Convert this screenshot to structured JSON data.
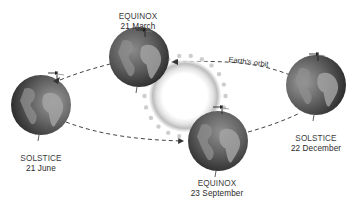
{
  "diagram": {
    "orbit_label": "Earth's orbit",
    "sun": {
      "name": "Sun"
    },
    "positions": [
      {
        "id": "june",
        "event": "SOLSTICE",
        "date": "21 June"
      },
      {
        "id": "march",
        "event": "EQUINOX",
        "date": "21 March"
      },
      {
        "id": "september",
        "event": "EQUINOX",
        "date": "23 September"
      },
      {
        "id": "december",
        "event": "SOLSTICE",
        "date": "22 December"
      }
    ],
    "colors": {
      "background": "#ffffff",
      "text": "#333333",
      "orbit_line": "#444444",
      "globe_dark": "#3a3a3a",
      "globe_mid": "#6e6e6e",
      "land": "#9a9a9a",
      "sun_glow": "#c8c8c8"
    }
  }
}
